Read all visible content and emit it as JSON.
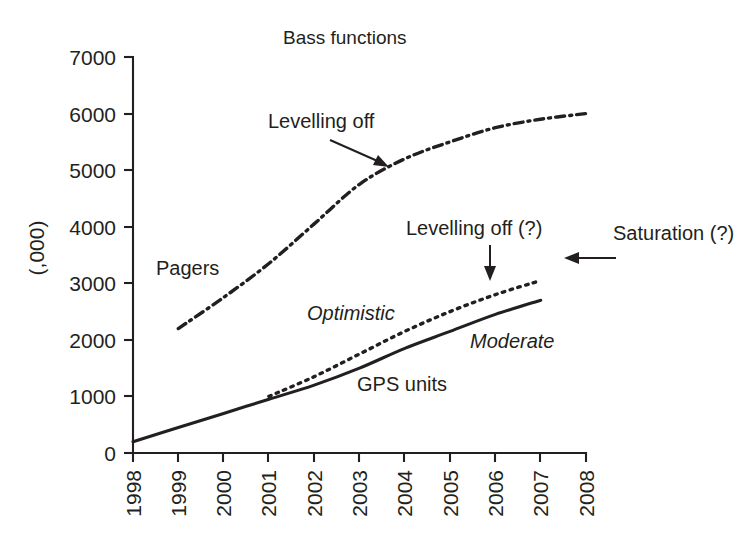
{
  "chart_data": {
    "type": "line",
    "title": "Bass functions",
    "xlabel": "",
    "ylabel": "(,000)",
    "grid": false,
    "legend_position": "inline-labels",
    "xlim": [
      1998,
      2008
    ],
    "ylim": [
      0,
      7000
    ],
    "x_tick_labels": [
      "1998",
      "1999",
      "2000",
      "2001",
      "2002",
      "2003",
      "2004",
      "2005",
      "2006",
      "2007",
      "2008"
    ],
    "y_tick_labels": [
      "0",
      "1000",
      "2000",
      "3000",
      "4000",
      "5000",
      "6000",
      "7000"
    ],
    "y_ticks": [
      0,
      1000,
      2000,
      3000,
      4000,
      5000,
      6000,
      7000
    ],
    "series": [
      {
        "name": "Pagers",
        "style": "dash-dot",
        "x": [
          1999,
          2000,
          2001,
          2002,
          2003,
          2004,
          2005,
          2006,
          2007,
          2008
        ],
        "values": [
          2200,
          2750,
          3350,
          4050,
          4750,
          5200,
          5500,
          5750,
          5900,
          6000
        ]
      },
      {
        "name": "Optimistic",
        "style": "dotted",
        "x": [
          2001,
          2002,
          2003,
          2004,
          2005,
          2006,
          2007
        ],
        "values": [
          1000,
          1350,
          1750,
          2150,
          2500,
          2800,
          3050
        ]
      },
      {
        "name": "Moderate",
        "style": "solid",
        "x": [
          1998,
          1999,
          2000,
          2001,
          2002,
          2003,
          2004,
          2005,
          2006,
          2007
        ],
        "values": [
          200,
          450,
          700,
          950,
          1200,
          1500,
          1850,
          2150,
          2450,
          2700
        ]
      }
    ],
    "annotations": [
      {
        "text": "Levelling off",
        "note": "arrow to pagers curve near 2004"
      },
      {
        "text": "Levelling off (?)",
        "note": "arrow down to optimistic curve near 2006"
      },
      {
        "text": "Saturation (?)",
        "note": "left arrow toward plot"
      },
      {
        "text": "Pagers",
        "note": "curve label for dash-dot series"
      },
      {
        "text": "Optimistic",
        "note": "italic curve label for dotted series"
      },
      {
        "text": "Moderate",
        "note": "italic curve label for solid series"
      },
      {
        "text": "GPS units",
        "note": "label for the solid moderate curve"
      }
    ]
  },
  "labels": {
    "title": "Bass functions",
    "y_axis": "(,000)",
    "pagers": "Pagers",
    "optimistic": "Optimistic",
    "moderate": "Moderate",
    "gps_units": "GPS units",
    "levelling_off": "Levelling off",
    "levelling_off_q": "Levelling off (?)",
    "saturation_q": "Saturation (?)"
  },
  "y_ticks": [
    {
      "label": "7000"
    },
    {
      "label": "6000"
    },
    {
      "label": "5000"
    },
    {
      "label": "4000"
    },
    {
      "label": "3000"
    },
    {
      "label": "2000"
    },
    {
      "label": "1000"
    },
    {
      "label": "0"
    }
  ],
  "x_ticks": [
    {
      "label": "1998"
    },
    {
      "label": "1999"
    },
    {
      "label": "2000"
    },
    {
      "label": "2001"
    },
    {
      "label": "2002"
    },
    {
      "label": "2003"
    },
    {
      "label": "2004"
    },
    {
      "label": "2005"
    },
    {
      "label": "2006"
    },
    {
      "label": "2007"
    },
    {
      "label": "2008"
    }
  ],
  "colors": {
    "ink": "#231f20",
    "background": "#ffffff"
  }
}
